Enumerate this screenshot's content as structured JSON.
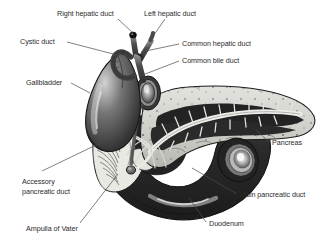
{
  "figure": {
    "width": 325,
    "height": 242,
    "background_color": "#ffffff",
    "style": "grayscale medical illustration with leader-line labels"
  },
  "colors": {
    "text": "#2b2b2b",
    "leader_line": "#4a4a4a",
    "outline": "#1a1a1a",
    "duodenum_dark": "#2e2e2e",
    "duodenum_mid": "#555555",
    "gallbladder_dark": "#3a3a3a",
    "gallbladder_highlight": "#cfcfcf",
    "pancreas_light": "#d8d8d4",
    "pancreas_interior": "#2a2a2a",
    "duct_light": "#ececea",
    "mucosa_light": "#e6e6e2",
    "ampulla_node": "#6b6b6b"
  },
  "labels": [
    {
      "id": "right-hepatic-duct",
      "text": "Right hepatic duct",
      "text_x": 57,
      "text_y": 16,
      "anchor": "start",
      "leader": "M 118 19 L 133 33"
    },
    {
      "id": "left-hepatic-duct",
      "text": "Left hepatic duct",
      "text_x": 144,
      "text_y": 16,
      "anchor": "start",
      "leader": "M 165 19 L 151 39"
    },
    {
      "id": "cystic-duct",
      "text": "Cystic duct",
      "text_x": 20,
      "text_y": 44,
      "anchor": "start",
      "leader": "M 67 42 L 121 56"
    },
    {
      "id": "common-hepatic-duct",
      "text": "Common hepatic duct",
      "text_x": 182,
      "text_y": 46,
      "anchor": "start",
      "leader": "M 179 44 L 141 52"
    },
    {
      "id": "common-bile-duct",
      "text": "Common bile duct",
      "text_x": 182,
      "text_y": 63,
      "anchor": "start",
      "leader": "M 179 61 L 140 76"
    },
    {
      "id": "gallbladder",
      "text": "Gallbladder",
      "text_x": 26,
      "text_y": 85,
      "anchor": "start",
      "leader": "M 71 83 L 90 93"
    },
    {
      "id": "pancreas",
      "text": "Pancreas",
      "text_x": 272,
      "text_y": 145,
      "anchor": "start",
      "leader": "M 269 142 L 256 130"
    },
    {
      "id": "accessory-pancreatic-duct",
      "text": "Accessory",
      "text_x": 22,
      "text_y": 184,
      "anchor": "start",
      "leader": "M 42 171 L 119 134"
    },
    {
      "id": "accessory-pancreatic-duct-line2",
      "text": "pancreatic duct",
      "text_x": 22,
      "text_y": 194,
      "anchor": "start",
      "leader": ""
    },
    {
      "id": "ampulla-of-vater",
      "text": "Ampulla of Vater",
      "text_x": 26,
      "text_y": 231,
      "anchor": "start",
      "leader": "M 80 223 L 118 174"
    },
    {
      "id": "main-pancreatic-duct",
      "text": "Main pancreatic duct",
      "text_x": 240,
      "text_y": 197,
      "anchor": "start",
      "leader": "M 237 194 L 192 168"
    },
    {
      "id": "duodenum",
      "text": "Duodenum",
      "text_x": 209,
      "text_y": 226,
      "anchor": "start",
      "leader": "M 206 222 L 189 198"
    }
  ],
  "structures": [
    {
      "id": "right-hepatic-duct",
      "name": "Right hepatic duct"
    },
    {
      "id": "left-hepatic-duct",
      "name": "Left hepatic duct"
    },
    {
      "id": "common-hepatic-duct",
      "name": "Common hepatic duct"
    },
    {
      "id": "cystic-duct",
      "name": "Cystic duct"
    },
    {
      "id": "common-bile-duct",
      "name": "Common bile duct"
    },
    {
      "id": "gallbladder",
      "name": "Gallbladder"
    },
    {
      "id": "pancreas",
      "name": "Pancreas"
    },
    {
      "id": "main-pancreatic-duct",
      "name": "Main pancreatic duct"
    },
    {
      "id": "accessory-pancreatic-duct",
      "name": "Accessory pancreatic duct"
    },
    {
      "id": "ampulla-of-vater",
      "name": "Ampulla of Vater"
    },
    {
      "id": "duodenum",
      "name": "Duodenum"
    }
  ]
}
